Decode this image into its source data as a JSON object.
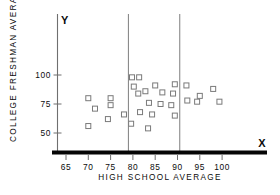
{
  "chart_data": {
    "type": "scatter",
    "title": "",
    "xlabel": "HIGH SCHOOL AVERAGE",
    "ylabel": "COLLEGE FRESHMAN AVERAGE",
    "x_axis_letter": "X",
    "y_axis_letter": "Y",
    "xlim": [
      62,
      103
    ],
    "ylim": [
      40,
      118
    ],
    "xticks": [
      65,
      70,
      75,
      80,
      85,
      90,
      95,
      100
    ],
    "xtick_labels": [
      "65",
      "70",
      "75",
      "80",
      "85",
      "90",
      "95",
      "100"
    ],
    "yticks": [
      50,
      75,
      100
    ],
    "ytick_labels": [
      "50",
      "75",
      "100"
    ],
    "grid": false,
    "legend": null,
    "vertical_reference_lines": [
      79,
      90.5
    ],
    "marker_style": "open-square",
    "points": [
      {
        "x": 70.0,
        "y": 80
      },
      {
        "x": 71.5,
        "y": 71
      },
      {
        "x": 70.0,
        "y": 56
      },
      {
        "x": 75.0,
        "y": 80
      },
      {
        "x": 75.0,
        "y": 74
      },
      {
        "x": 74.4,
        "y": 62
      },
      {
        "x": 78.0,
        "y": 66
      },
      {
        "x": 79.8,
        "y": 98
      },
      {
        "x": 81.4,
        "y": 98
      },
      {
        "x": 80.2,
        "y": 90
      },
      {
        "x": 81.2,
        "y": 84
      },
      {
        "x": 82.8,
        "y": 86
      },
      {
        "x": 85.0,
        "y": 91
      },
      {
        "x": 83.6,
        "y": 76
      },
      {
        "x": 81.6,
        "y": 68
      },
      {
        "x": 84.3,
        "y": 66
      },
      {
        "x": 79.6,
        "y": 58
      },
      {
        "x": 83.4,
        "y": 54
      },
      {
        "x": 86.6,
        "y": 85
      },
      {
        "x": 86.2,
        "y": 75
      },
      {
        "x": 88.6,
        "y": 74
      },
      {
        "x": 89.0,
        "y": 84
      },
      {
        "x": 89.4,
        "y": 92
      },
      {
        "x": 89.4,
        "y": 65
      },
      {
        "x": 92.0,
        "y": 91
      },
      {
        "x": 92.2,
        "y": 78
      },
      {
        "x": 94.4,
        "y": 77
      },
      {
        "x": 95.0,
        "y": 82
      },
      {
        "x": 98.0,
        "y": 88
      },
      {
        "x": 99.4,
        "y": 77
      }
    ]
  },
  "colors": {
    "marker_stroke": "#7a7a7a",
    "marker_fill": "#ffffff",
    "axis": "#6f6f6f",
    "baseline": "#050505",
    "divider": "#8a8a8a",
    "text": "#0b0b0b",
    "background": "#ffffff"
  }
}
